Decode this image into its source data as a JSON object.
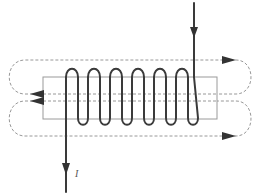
{
  "diagram": {
    "type": "solenoid-magnetic-field",
    "current_label": "I",
    "coil_turns": 6,
    "colors": {
      "wire": "#3a3a3a",
      "core_outline": "#9a9a9a",
      "flux_lines": "#8c8c8c",
      "arrows": "#333333"
    },
    "elements": {
      "core": "rectangular core",
      "coil": "helical winding",
      "input_lead": "current in (top right, arrow down)",
      "output_lead": "current out (bottom left, arrow down)",
      "flux_upper": "upper flux loop, arrows right on top, left through core",
      "flux_lower": "lower flux loop, arrows left through core, right on bottom"
    }
  }
}
